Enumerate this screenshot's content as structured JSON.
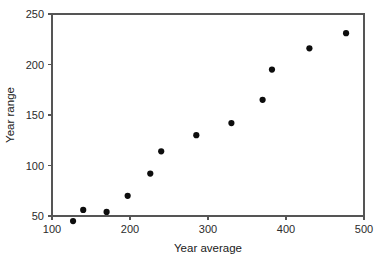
{
  "chart_data": {
    "type": "scatter",
    "title": "",
    "xlabel": "Year average",
    "ylabel": "Year range",
    "xlim": [
      100,
      500
    ],
    "ylim": [
      50,
      250
    ],
    "xticks": [
      100,
      200,
      300,
      400,
      500
    ],
    "yticks": [
      50,
      100,
      150,
      200,
      250
    ],
    "xticklabels": [
      "100",
      "200",
      "300",
      "400",
      "500"
    ],
    "yticklabels": [
      "50",
      "100",
      "150",
      "200",
      "250"
    ],
    "grid": false,
    "legend": null,
    "marker": "filled-circle",
    "marker_color": "#0d0d0d",
    "series": [
      {
        "name": "",
        "x": [
          127,
          140,
          170,
          197,
          226,
          240,
          285,
          330,
          370,
          382,
          430,
          477
        ],
        "y": [
          45,
          56,
          54,
          70,
          92,
          114,
          130,
          142,
          165,
          195,
          216,
          231
        ]
      }
    ]
  },
  "axes": {
    "x_title": "Year average",
    "y_title": "Year range"
  }
}
